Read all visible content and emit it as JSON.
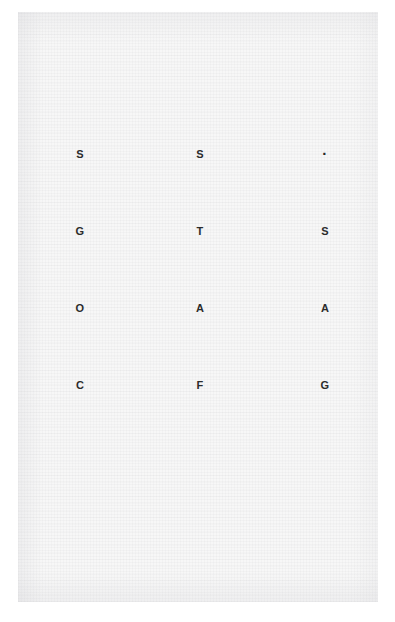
{
  "page": {
    "kind": "scanned-document-page",
    "paper_color": "#f7f7f7",
    "ink_color": "#2b2b2b",
    "background_color": "#ffffff"
  },
  "grid": {
    "columns": 3,
    "rows": 4,
    "column_x": [
      80,
      200,
      325
    ],
    "row_y": [
      154,
      231,
      308,
      385
    ],
    "cells": [
      {
        "row": 1,
        "col": 1,
        "text": "S",
        "kind": "letter"
      },
      {
        "row": 1,
        "col": 2,
        "text": "S",
        "kind": "letter"
      },
      {
        "row": 1,
        "col": 3,
        "text": "·",
        "kind": "dot"
      },
      {
        "row": 2,
        "col": 1,
        "text": "G",
        "kind": "letter"
      },
      {
        "row": 2,
        "col": 2,
        "text": "T",
        "kind": "letter"
      },
      {
        "row": 2,
        "col": 3,
        "text": "S",
        "kind": "letter"
      },
      {
        "row": 3,
        "col": 1,
        "text": "O",
        "kind": "letter"
      },
      {
        "row": 3,
        "col": 2,
        "text": "A",
        "kind": "letter"
      },
      {
        "row": 3,
        "col": 3,
        "text": "A",
        "kind": "letter"
      },
      {
        "row": 4,
        "col": 1,
        "text": "C",
        "kind": "letter"
      },
      {
        "row": 4,
        "col": 2,
        "text": "F",
        "kind": "letter"
      },
      {
        "row": 4,
        "col": 3,
        "text": "G",
        "kind": "letter"
      }
    ]
  },
  "caption": {
    "text": ""
  }
}
